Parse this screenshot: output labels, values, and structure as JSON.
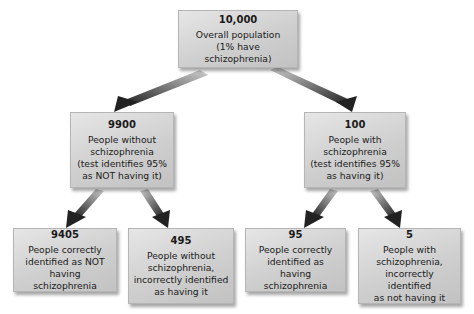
{
  "diagram": {
    "type": "probability-tree",
    "nodes": {
      "root": {
        "count": "10,000",
        "label": "Overall population\n(1% have schizophrenia)"
      },
      "without": {
        "count": "9900",
        "label": "People without\nschizophrenia\n(test identifies 95%\nas NOT having it)"
      },
      "with": {
        "count": "100",
        "label": "People with\nschizophrenia\n(test identifies 95%\nas having it)"
      },
      "true_negative": {
        "count": "9405",
        "label": "People correctly\nidentified as NOT\nhaving schizophrenia"
      },
      "false_positive": {
        "count": "495",
        "label": "People without\nschizophrenia,\nincorrectly identified\nas having it"
      },
      "true_positive": {
        "count": "95",
        "label": "People correctly\nidentified as\nhaving schizophrenia"
      },
      "false_negative": {
        "count": "5",
        "label": "People with\nschizophrenia,\nincorrectly identified\nas not having it"
      }
    },
    "edges": [
      [
        "root",
        "without"
      ],
      [
        "root",
        "with"
      ],
      [
        "without",
        "true_negative"
      ],
      [
        "without",
        "false_positive"
      ],
      [
        "with",
        "true_positive"
      ],
      [
        "with",
        "false_negative"
      ]
    ],
    "colors": {
      "box_fill": "#cfcfcf",
      "arrow_dark": "#2a2a2a",
      "arrow_light": "#bdbdbd"
    }
  }
}
